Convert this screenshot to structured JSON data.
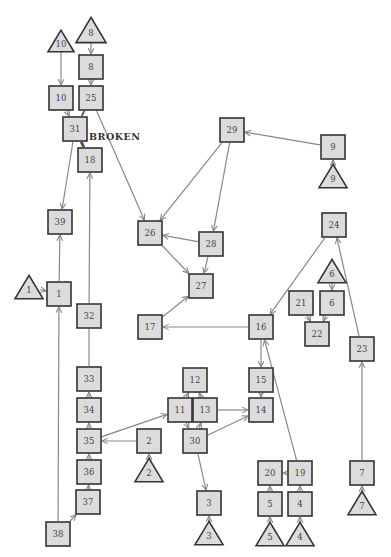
{
  "diagram": {
    "annotation": {
      "text": "BROKEN",
      "x": 89,
      "y": 140
    },
    "colors": {
      "node_fill": "#dcdcdc",
      "node_stroke": "#333333",
      "edge": "#888888",
      "edge_dark": "#444444"
    },
    "nodes": [
      {
        "id": "T8",
        "label": "8",
        "shape": "triangle",
        "x": 91,
        "y": 30,
        "size": 28
      },
      {
        "id": "8",
        "label": "8",
        "shape": "square",
        "x": 91,
        "y": 67
      },
      {
        "id": "T10",
        "label": "10",
        "shape": "triangle",
        "x": 61,
        "y": 41,
        "size": 24
      },
      {
        "id": "10",
        "label": "10",
        "shape": "square",
        "x": 61,
        "y": 98
      },
      {
        "id": "25",
        "label": "25",
        "shape": "square",
        "x": 91,
        "y": 98
      },
      {
        "id": "31",
        "label": "31",
        "shape": "square",
        "x": 75,
        "y": 129
      },
      {
        "id": "18",
        "label": "18",
        "shape": "square",
        "x": 90,
        "y": 160
      },
      {
        "id": "39",
        "label": "39",
        "shape": "square",
        "x": 60,
        "y": 222
      },
      {
        "id": "T1",
        "label": "1",
        "shape": "triangle",
        "x": 29,
        "y": 287,
        "size": 26
      },
      {
        "id": "1",
        "label": "1",
        "shape": "square",
        "x": 59,
        "y": 294
      },
      {
        "id": "32",
        "label": "32",
        "shape": "square",
        "x": 89,
        "y": 316
      },
      {
        "id": "33",
        "label": "33",
        "shape": "square",
        "x": 89,
        "y": 379
      },
      {
        "id": "34",
        "label": "34",
        "shape": "square",
        "x": 89,
        "y": 410
      },
      {
        "id": "35",
        "label": "35",
        "shape": "square",
        "x": 89,
        "y": 441
      },
      {
        "id": "36",
        "label": "36",
        "shape": "square",
        "x": 89,
        "y": 472
      },
      {
        "id": "37",
        "label": "37",
        "shape": "square",
        "x": 88,
        "y": 502
      },
      {
        "id": "38",
        "label": "38",
        "shape": "square",
        "x": 58,
        "y": 534
      },
      {
        "id": "2",
        "label": "2",
        "shape": "square",
        "x": 149,
        "y": 441
      },
      {
        "id": "T2",
        "label": "2",
        "shape": "triangle",
        "x": 149,
        "y": 470,
        "size": 26
      },
      {
        "id": "26",
        "label": "26",
        "shape": "square",
        "x": 150,
        "y": 233
      },
      {
        "id": "28",
        "label": "28",
        "shape": "square",
        "x": 211,
        "y": 244
      },
      {
        "id": "27",
        "label": "27",
        "shape": "square",
        "x": 201,
        "y": 286
      },
      {
        "id": "17",
        "label": "17",
        "shape": "square",
        "x": 150,
        "y": 327
      },
      {
        "id": "29",
        "label": "29",
        "shape": "square",
        "x": 232,
        "y": 130
      },
      {
        "id": "9",
        "label": "9",
        "shape": "square",
        "x": 333,
        "y": 147
      },
      {
        "id": "T9",
        "label": "9",
        "shape": "triangle",
        "x": 333,
        "y": 176,
        "size": 26
      },
      {
        "id": "24",
        "label": "24",
        "shape": "square",
        "x": 334,
        "y": 225
      },
      {
        "id": "T6",
        "label": "6",
        "shape": "triangle",
        "x": 332,
        "y": 271,
        "size": 26
      },
      {
        "id": "21",
        "label": "21",
        "shape": "square",
        "x": 301,
        "y": 303
      },
      {
        "id": "6",
        "label": "6",
        "shape": "square",
        "x": 332,
        "y": 303
      },
      {
        "id": "22",
        "label": "22",
        "shape": "square",
        "x": 317,
        "y": 334
      },
      {
        "id": "23",
        "label": "23",
        "shape": "square",
        "x": 362,
        "y": 349
      },
      {
        "id": "16",
        "label": "16",
        "shape": "square",
        "x": 261,
        "y": 327
      },
      {
        "id": "12",
        "label": "12",
        "shape": "square",
        "x": 195,
        "y": 380
      },
      {
        "id": "11",
        "label": "11",
        "shape": "square",
        "x": 180,
        "y": 410
      },
      {
        "id": "13",
        "label": "13",
        "shape": "square",
        "x": 205,
        "y": 410
      },
      {
        "id": "30",
        "label": "30",
        "shape": "square",
        "x": 195,
        "y": 441
      },
      {
        "id": "15",
        "label": "15",
        "shape": "square",
        "x": 261,
        "y": 380
      },
      {
        "id": "14",
        "label": "14",
        "shape": "square",
        "x": 261,
        "y": 410
      },
      {
        "id": "3",
        "label": "3",
        "shape": "square",
        "x": 209,
        "y": 503
      },
      {
        "id": "T3",
        "label": "3",
        "shape": "triangle",
        "x": 209,
        "y": 533,
        "size": 26
      },
      {
        "id": "20",
        "label": "20",
        "shape": "square",
        "x": 270,
        "y": 473
      },
      {
        "id": "19",
        "label": "19",
        "shape": "square",
        "x": 300,
        "y": 473
      },
      {
        "id": "5",
        "label": "5",
        "shape": "square",
        "x": 270,
        "y": 504
      },
      {
        "id": "T5",
        "label": "5",
        "shape": "triangle",
        "x": 270,
        "y": 534,
        "size": 26
      },
      {
        "id": "4",
        "label": "4",
        "shape": "square",
        "x": 300,
        "y": 504
      },
      {
        "id": "T4",
        "label": "4",
        "shape": "triangle",
        "x": 300,
        "y": 534,
        "size": 26
      },
      {
        "id": "7",
        "label": "7",
        "shape": "square",
        "x": 362,
        "y": 473
      },
      {
        "id": "T7",
        "label": "7",
        "shape": "triangle",
        "x": 362,
        "y": 503,
        "size": 26
      }
    ],
    "edges": [
      {
        "from": "T8",
        "to": "8"
      },
      {
        "from": "8",
        "to": "25"
      },
      {
        "from": "T10",
        "to": "10"
      },
      {
        "from": "10",
        "to": "31"
      },
      {
        "from": "25",
        "to": "31",
        "style": "dark",
        "arrow": false
      },
      {
        "from": "31",
        "to": "18",
        "style": "broken",
        "arrow": false
      },
      {
        "from": "25",
        "to": "26"
      },
      {
        "from": "31",
        "to": "39"
      },
      {
        "from": "1",
        "to": "39"
      },
      {
        "from": "T1",
        "to": "1"
      },
      {
        "from": "1",
        "to": "38",
        "reverse": true
      },
      {
        "from": "38",
        "to": "37"
      },
      {
        "from": "37",
        "to": "36"
      },
      {
        "from": "36",
        "to": "35"
      },
      {
        "from": "35",
        "to": "34"
      },
      {
        "from": "34",
        "to": "33"
      },
      {
        "from": "33",
        "to": "32",
        "arrow": false
      },
      {
        "from": "32",
        "to": "18"
      },
      {
        "from": "2",
        "to": "35"
      },
      {
        "from": "T2",
        "to": "2"
      },
      {
        "from": "35",
        "to": "11"
      },
      {
        "from": "29",
        "to": "26"
      },
      {
        "from": "29",
        "to": "28"
      },
      {
        "from": "9",
        "to": "29"
      },
      {
        "from": "T9",
        "to": "9"
      },
      {
        "from": "28",
        "to": "26"
      },
      {
        "from": "26",
        "to": "27"
      },
      {
        "from": "28",
        "to": "27"
      },
      {
        "from": "17",
        "to": "27"
      },
      {
        "from": "16",
        "to": "17"
      },
      {
        "from": "24",
        "to": "16"
      },
      {
        "from": "23",
        "to": "24"
      },
      {
        "from": "T6",
        "to": "6"
      },
      {
        "from": "21",
        "to": "22"
      },
      {
        "from": "6",
        "to": "22"
      },
      {
        "from": "15",
        "to": "16",
        "reverse": true
      },
      {
        "from": "15",
        "to": "14"
      },
      {
        "from": "19",
        "to": "16"
      },
      {
        "from": "11",
        "to": "12"
      },
      {
        "from": "13",
        "to": "12"
      },
      {
        "from": "11",
        "to": "30"
      },
      {
        "from": "30",
        "to": "13"
      },
      {
        "from": "13",
        "to": "14"
      },
      {
        "from": "30",
        "to": "14"
      },
      {
        "from": "30",
        "to": "3"
      },
      {
        "from": "T3",
        "to": "3"
      },
      {
        "from": "19",
        "to": "20"
      },
      {
        "from": "5",
        "to": "20"
      },
      {
        "from": "T5",
        "to": "5"
      },
      {
        "from": "4",
        "to": "19"
      },
      {
        "from": "T4",
        "to": "4"
      },
      {
        "from": "7",
        "to": "23"
      },
      {
        "from": "T7",
        "to": "7"
      }
    ]
  }
}
